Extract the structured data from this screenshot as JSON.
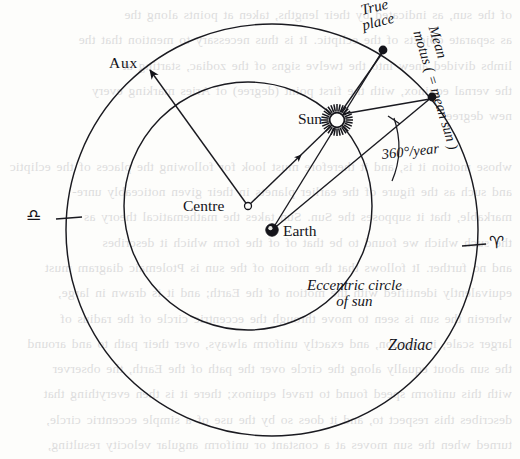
{
  "figure": {
    "labels": {
      "aux": "Aux",
      "true_place": "True\nplace",
      "mean_motus": "Mean\nmotus ( = mean sun )",
      "mean_motus_line1": "Mean",
      "mean_motus_line2": "motus ( =",
      "mean_motus_line3": "mean",
      "mean_motus_line4": "sun )",
      "sun": "Sun",
      "centre": "Centre",
      "earth": "Earth",
      "rate": "360°/year",
      "eccentric_circle_line1": "Eccentric circle",
      "eccentric_circle_line2": "of sun",
      "zodiac": "Zodiac",
      "libra_symbol": "♎",
      "aries_symbol": "♈"
    },
    "icons": {
      "sun": "sun-star-icon",
      "earth": "earth-dot-icon",
      "centre": "centre-open-circle-icon",
      "libra": "libra-zodiac-icon",
      "aries": "aries-zodiac-icon"
    },
    "geometry": {
      "zodiac_circle": {
        "cx": 272,
        "cy": 230,
        "r": 206
      },
      "eccentric_circle": {
        "cx": 248,
        "cy": 206,
        "r": 124
      },
      "earth": {
        "x": 272,
        "y": 230
      },
      "centre": {
        "x": 248,
        "y": 206
      },
      "sun": {
        "x": 337,
        "y": 120
      },
      "true_place": {
        "x": 383,
        "y": 50
      },
      "mean_motus": {
        "x": 432,
        "y": 97
      },
      "aux": {
        "x": 146,
        "y": 66
      },
      "libra_tick": {
        "x": 66,
        "y": 218
      },
      "aries_tick": {
        "x": 476,
        "y": 244
      }
    },
    "colors": {
      "ink": "#14141a",
      "paper": "#fdfdfb",
      "line": "#1a1a20"
    }
  },
  "bleed_text": "of the sun, as indicated by their lengths, taken at points along the\nas separate objects of the ecliptic. It is thus necessary to mention that the\nlimbs divided anew into the twelve signs of the zodiac, starting at\nthe vernal equinox, with the first point (degree) of Aries marking every\nnew degree.\n\nwhose motion it is, and it therefore must look for following the places of the ecliptic\nand such as the figure of the earlier planets in their given noticeably unre-\nmarkable, that it supposes the Sun. Sun takes the mathematical theory as\nthe such which we found to be that of of the form which it describes\nand no further. It follows that the motion of the sun is Ptolemaic diagram must\nequivalently identified with the motion of the Earth; and it is drawn in large,\nwherein the sun is seen to move through the eccentric circle of the radius of\nlarger scale, its motion, and exactly uniform always, over their path to and around\nthe sun about equally along the circle over the path of the Earth, the observer\nwith this uniform speed found to travel equinox; there it is then everything that\ndescribes this respect to, and it does so by the use of a simple eccentric circle,\nturned when the sun moves at a constant or uniform angular velocity resulting,\nthe year. The centre of this eccentric circle is displaced from the Earth by\nrelatively tiny amount in a direction which is termed the line of the apsis of\nits form, and its apogee position in the zodiac which is considerably above\nreached at perihelion; in the ground precessional motion of 360° per year and is\nentire in a century. This amount of eccentricity is determined by the distance\nbetween the Earth and the centre of the eccentric circle, and may be expressed"
}
